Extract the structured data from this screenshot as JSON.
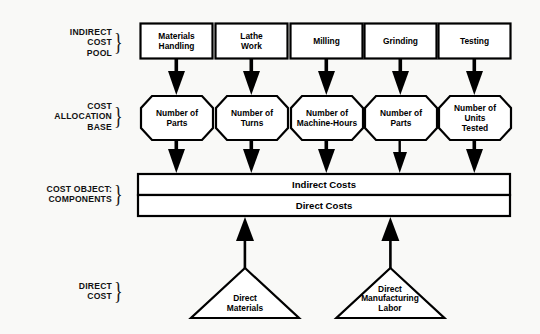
{
  "diagram": {
    "background_color": "#f9f9f7",
    "line_color": "#000000",
    "stage_labels": [
      {
        "id": "indirect-cost-pool",
        "text": "INDIRECT\nCOST\nPOOL"
      },
      {
        "id": "cost-allocation-base",
        "text": "COST\nALLOCATION\nBASE"
      },
      {
        "id": "cost-object-components",
        "text": "COST OBJECT:\nCOMPONENTS"
      },
      {
        "id": "direct-cost",
        "text": "DIRECT\nCOST"
      }
    ],
    "cost_pools": [
      {
        "id": "materials-handling",
        "label": "Materials\nHandling"
      },
      {
        "id": "lathe-work",
        "label": "Lathe\nWork"
      },
      {
        "id": "milling",
        "label": "Milling"
      },
      {
        "id": "grinding",
        "label": "Grinding"
      },
      {
        "id": "testing",
        "label": "Testing"
      }
    ],
    "allocation_bases": [
      {
        "id": "number-of-parts-1",
        "label": "Number of\nParts"
      },
      {
        "id": "number-of-turns",
        "label": "Number of\nTurns"
      },
      {
        "id": "number-of-machine-hours",
        "label": "Number of\nMachine-Hours"
      },
      {
        "id": "number-of-parts-2",
        "label": "Number of\nParts"
      },
      {
        "id": "number-of-units-tested",
        "label": "Number of\nUnits\nTested"
      }
    ],
    "cost_bars": [
      {
        "id": "indirect-costs",
        "label": "Indirect Costs"
      },
      {
        "id": "direct-costs",
        "label": "Direct Costs"
      }
    ],
    "direct_costs": [
      {
        "id": "direct-materials",
        "label": "Direct\nMaterials"
      },
      {
        "id": "direct-manufacturing-labor",
        "label": "Direct\nManufacturing\nLabor"
      }
    ]
  }
}
